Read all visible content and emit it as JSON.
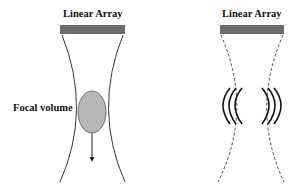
{
  "left_panel": {
    "array_label": "Linear Array",
    "focal_label": "Focal volume"
  },
  "right_panel": {
    "array_label": "Linear Array"
  },
  "colors": {
    "array_bar": "#6b6b6b",
    "focal_fill": "#b8b8b8",
    "line": "#222222"
  }
}
